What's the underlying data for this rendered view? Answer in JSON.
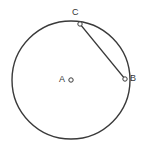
{
  "figure": {
    "type": "circle-geometry-diagram",
    "background_color": "#ffffff",
    "stroke_color": "#3a3a3a",
    "label_color": "#333333",
    "canvas": {
      "width": 144,
      "height": 151
    },
    "circle": {
      "name": "main-circle",
      "center_x": 71,
      "center_y": 80,
      "radius": 59,
      "stroke_width": 1.4,
      "fill": "none"
    },
    "points": [
      {
        "id": "A",
        "label": "A",
        "role": "center",
        "x": 71,
        "y": 80,
        "marker": "open-circle",
        "marker_radius": 2.2,
        "label_x": 59,
        "label_y": 75
      },
      {
        "id": "C",
        "label": "C",
        "role": "on-circle",
        "x": 80,
        "y": 24,
        "marker": "open-circle",
        "marker_radius": 2.2,
        "label_x": 72,
        "label_y": 8
      },
      {
        "id": "B",
        "label": "B",
        "role": "on-circle",
        "x": 125,
        "y": 79,
        "marker": "open-circle",
        "marker_radius": 2.2,
        "label_x": 130,
        "label_y": 74
      }
    ],
    "segments": [
      {
        "id": "chord-CB",
        "from": "C",
        "to": "B",
        "x1": 80,
        "y1": 24,
        "x2": 125,
        "y2": 79,
        "stroke_width": 1.2,
        "style": "solid"
      }
    ]
  }
}
